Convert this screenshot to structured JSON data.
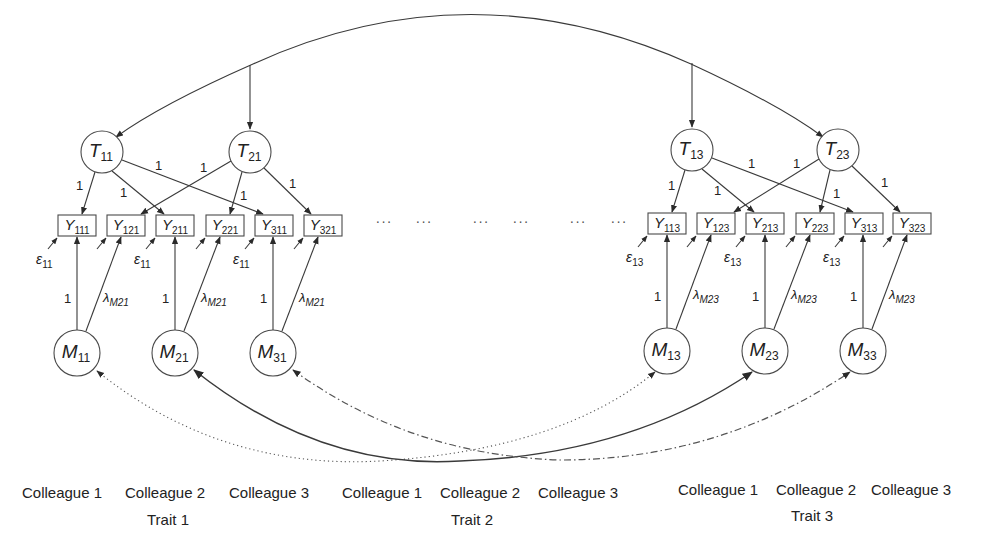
{
  "trait_factors": [
    {
      "id": "T11",
      "main": "T",
      "sub": "11",
      "cx": 102,
      "cy": 152
    },
    {
      "id": "T21",
      "main": "T",
      "sub": "21",
      "cx": 250,
      "cy": 152
    },
    {
      "id": "T13",
      "main": "T",
      "sub": "13",
      "cx": 692,
      "cy": 150
    },
    {
      "id": "T23",
      "main": "T",
      "sub": "23",
      "cx": 838,
      "cy": 150
    }
  ],
  "method_factors": [
    {
      "id": "M11",
      "main": "M",
      "sub": "11",
      "cx": 77,
      "cy": 353
    },
    {
      "id": "M21",
      "main": "M",
      "sub": "21",
      "cx": 175,
      "cy": 353
    },
    {
      "id": "M31",
      "main": "M",
      "sub": "31",
      "cx": 273,
      "cy": 353
    },
    {
      "id": "M13",
      "main": "M",
      "sub": "13",
      "cx": 667,
      "cy": 351
    },
    {
      "id": "M23",
      "main": "M",
      "sub": "23",
      "cx": 765,
      "cy": 351
    },
    {
      "id": "M33",
      "main": "M",
      "sub": "33",
      "cx": 863,
      "cy": 351
    }
  ],
  "indicators": [
    {
      "id": "Y111",
      "main": "Y",
      "sub": "111",
      "x": 58,
      "y": 215
    },
    {
      "id": "Y121",
      "main": "Y",
      "sub": "121",
      "x": 107,
      "y": 215
    },
    {
      "id": "Y211",
      "main": "Y",
      "sub": "211",
      "x": 156,
      "y": 215
    },
    {
      "id": "Y221",
      "main": "Y",
      "sub": "221",
      "x": 206,
      "y": 215
    },
    {
      "id": "Y311",
      "main": "Y",
      "sub": "311",
      "x": 255,
      "y": 215
    },
    {
      "id": "Y321",
      "main": "Y",
      "sub": "321",
      "x": 304,
      "y": 215
    },
    {
      "id": "Y113",
      "main": "Y",
      "sub": "113",
      "x": 648,
      "y": 213
    },
    {
      "id": "Y123",
      "main": "Y",
      "sub": "123",
      "x": 697,
      "y": 213
    },
    {
      "id": "Y213",
      "main": "Y",
      "sub": "213",
      "x": 746,
      "y": 213
    },
    {
      "id": "Y223",
      "main": "Y",
      "sub": "223",
      "x": 796,
      "y": 213
    },
    {
      "id": "Y313",
      "main": "Y",
      "sub": "313",
      "x": 845,
      "y": 213
    },
    {
      "id": "Y323",
      "main": "Y",
      "sub": "323",
      "x": 893,
      "y": 213
    }
  ],
  "error_labels": [
    {
      "main": "ε",
      "sub": "11",
      "x": 36,
      "y": 264
    },
    {
      "main": "ε",
      "sub": "11",
      "x": 134,
      "y": 264
    },
    {
      "main": "ε",
      "sub": "11",
      "x": 233,
      "y": 264
    },
    {
      "main": "ε",
      "sub": "13",
      "x": 626,
      "y": 262
    },
    {
      "main": "ε",
      "sub": "13",
      "x": 724,
      "y": 262
    },
    {
      "main": "ε",
      "sub": "13",
      "x": 823,
      "y": 262
    }
  ],
  "trait_loading_labels": [
    {
      "text": "1",
      "x": 76,
      "y": 190
    },
    {
      "text": "1",
      "x": 120,
      "y": 197
    },
    {
      "text": "1",
      "x": 155,
      "y": 170
    },
    {
      "text": "1",
      "x": 200,
      "y": 172
    },
    {
      "text": "1",
      "x": 240,
      "y": 200
    },
    {
      "text": "1",
      "x": 289,
      "y": 188
    },
    {
      "text": "1",
      "x": 668,
      "y": 190
    },
    {
      "text": "1",
      "x": 714,
      "y": 195
    },
    {
      "text": "1",
      "x": 748,
      "y": 168
    },
    {
      "text": "1",
      "x": 793,
      "y": 168
    },
    {
      "text": "1",
      "x": 833,
      "y": 198
    },
    {
      "text": "1",
      "x": 881,
      "y": 187
    }
  ],
  "method_loading_labels": [
    {
      "text": "1",
      "x": 64,
      "y": 303
    },
    {
      "text": "1",
      "x": 162,
      "y": 303
    },
    {
      "text": "1",
      "x": 260,
      "y": 303
    },
    {
      "text": "1",
      "x": 654,
      "y": 301
    },
    {
      "text": "1",
      "x": 752,
      "y": 301
    },
    {
      "text": "1",
      "x": 850,
      "y": 301
    }
  ],
  "lambda_labels": [
    {
      "main": "λ",
      "sub": "M21",
      "x": 103,
      "y": 302
    },
    {
      "main": "λ",
      "sub": "M21",
      "x": 201,
      "y": 302
    },
    {
      "main": "λ",
      "sub": "M21",
      "x": 299,
      "y": 302
    },
    {
      "main": "λ",
      "sub": "M23",
      "x": 693,
      "y": 299
    },
    {
      "main": "λ",
      "sub": "M23",
      "x": 791,
      "y": 299
    },
    {
      "main": "λ",
      "sub": "M23",
      "x": 889,
      "y": 299
    }
  ],
  "ellipsis": [
    {
      "text": "···",
      "x": 384,
      "y": 226
    },
    {
      "text": "···",
      "x": 424,
      "y": 226
    },
    {
      "text": "···",
      "x": 481,
      "y": 226
    },
    {
      "text": "···",
      "x": 521,
      "y": 226
    },
    {
      "text": "···",
      "x": 578,
      "y": 226
    },
    {
      "text": "···",
      "x": 619,
      "y": 226
    }
  ],
  "groups": [
    {
      "colleagues": [
        "Colleague 1",
        "Colleague 2",
        "Colleague 3"
      ],
      "colleague_x": [
        62,
        165,
        269
      ],
      "colleague_y": 498,
      "trait": "Trait 1",
      "trait_x": 168,
      "trait_y": 525
    },
    {
      "colleagues": [
        "Colleague 1",
        "Colleague 2",
        "Colleague 3"
      ],
      "colleague_x": [
        382,
        480,
        578
      ],
      "colleague_y": 498,
      "trait": "Trait 2",
      "trait_x": 472,
      "trait_y": 525
    },
    {
      "colleagues": [
        "Colleague 1",
        "Colleague 2",
        "Colleague 3"
      ],
      "colleague_x": [
        718,
        816,
        911
      ],
      "colleague_y": 495,
      "trait": "Trait 3",
      "trait_x": 812,
      "trait_y": 521
    }
  ],
  "colors": {
    "line": "#3a3a3a",
    "background": "#ffffff"
  }
}
